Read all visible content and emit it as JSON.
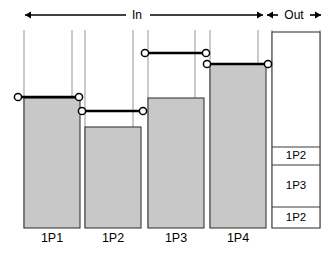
{
  "figure": {
    "width": 333,
    "height": 256,
    "background": "#ffffff",
    "fill_color": "#c8c8c8",
    "outline_color": "#3a3a3a",
    "guide_color": "#b4b4b4",
    "line_color": "#000000"
  },
  "header": {
    "in_label": "In",
    "out_label": "Out",
    "in_arrow": {
      "left_x": 25,
      "right_x": 263,
      "y": 15,
      "label_x": 137,
      "gap_left": 126,
      "gap_right": 150
    },
    "out_arrow": {
      "left_x": 267,
      "right_x": 321,
      "y": 15,
      "label_x": 294,
      "gap_left": 278,
      "gap_right": 310
    }
  },
  "guides": {
    "y_top": 30,
    "y_bottom": 228,
    "x_positions": [
      24,
      72,
      85,
      133,
      148,
      195,
      210,
      258,
      272,
      320
    ]
  },
  "bars": [
    {
      "id": "bar-1",
      "label": "1P1",
      "x_left": 24,
      "x_right": 80,
      "fill_top": 98,
      "bottom": 228,
      "tube_top": 32,
      "connector": {
        "y": 97,
        "x_start": 18,
        "x_end": 79,
        "marker_left_x": 18,
        "marker_right_x": 79
      }
    },
    {
      "id": "bar-2",
      "label": "1P2",
      "x_left": 85,
      "x_right": 141,
      "fill_top": 127,
      "bottom": 228,
      "tube_top": 32,
      "connector": {
        "y": 111,
        "x_start": 82,
        "x_end": 143,
        "marker_left_x": 82,
        "marker_right_x": 143
      }
    },
    {
      "id": "bar-3",
      "label": "1P3",
      "x_left": 148,
      "x_right": 204,
      "fill_top": 98,
      "bottom": 228,
      "tube_top": 32,
      "connector": {
        "y": 53,
        "x_start": 145,
        "x_end": 206,
        "marker_left_x": 145,
        "marker_right_x": 206
      }
    },
    {
      "id": "bar-4",
      "label": "1P4",
      "x_left": 210,
      "x_right": 266,
      "fill_top": 64,
      "bottom": 228,
      "tube_top": 32,
      "connector": {
        "y": 64,
        "x_start": 207,
        "x_end": 268,
        "marker_left_x": 207,
        "marker_right_x": 268
      }
    }
  ],
  "output_column": {
    "id": "output-stack",
    "x_left": 272,
    "x_right": 320,
    "top": 32,
    "bottom": 228,
    "dividers": [
      147,
      165,
      207
    ],
    "cells": [
      {
        "label": "1P2",
        "top": 147,
        "bottom": 165
      },
      {
        "label": "1P3",
        "top": 165,
        "bottom": 207
      },
      {
        "label": "1P2",
        "top": 207,
        "bottom": 228
      }
    ]
  },
  "bar_label_y": 239
}
